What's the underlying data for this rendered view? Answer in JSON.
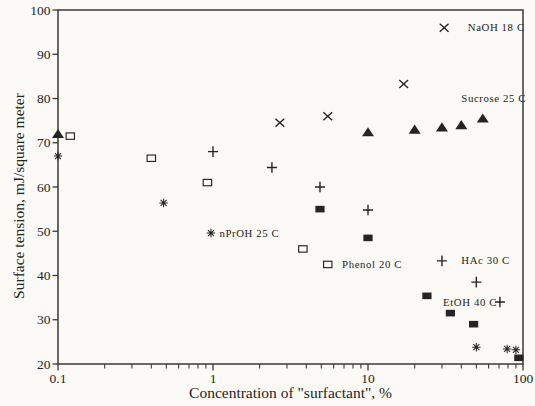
{
  "figure": {
    "background_color": "#fbfaf7",
    "ink_color": "#242424",
    "frame_color": "#3a3a3a"
  },
  "chart_data": {
    "type": "scatter",
    "title": "",
    "xlabel": "Concentration of \"surfactant\", %",
    "ylabel": "Surface tension, mJ/square meter",
    "x_scale": "log",
    "y_scale": "linear",
    "xlim": [
      0.1,
      100
    ],
    "ylim": [
      20,
      100
    ],
    "grid": false,
    "frame": "full-box",
    "legend_position": "labels-annotated-beside-series",
    "x_ticks": [
      {
        "v": 0.1,
        "label": "0.1"
      },
      {
        "v": 1,
        "label": "1"
      },
      {
        "v": 10,
        "label": "10"
      },
      {
        "v": 100,
        "label": "100"
      }
    ],
    "x_minor_ticks": [
      0.2,
      0.3,
      0.4,
      0.5,
      0.6,
      0.7,
      0.8,
      0.9,
      2,
      3,
      4,
      5,
      6,
      7,
      8,
      9,
      20,
      30,
      40,
      50,
      60,
      70,
      80,
      90
    ],
    "y_ticks": [
      {
        "v": 20,
        "label": "20"
      },
      {
        "v": 30,
        "label": "30"
      },
      {
        "v": 40,
        "label": "40"
      },
      {
        "v": 50,
        "label": "50"
      },
      {
        "v": 60,
        "label": "60"
      },
      {
        "v": 70,
        "label": "70"
      },
      {
        "v": 80,
        "label": "80"
      },
      {
        "v": 90,
        "label": "90"
      },
      {
        "v": 100,
        "label": "100"
      }
    ],
    "series": [
      {
        "name": "naoh",
        "label": "NaOH 18 C",
        "marker": "x-marker",
        "points": [
          [
            2.7,
            74.5
          ],
          [
            5.5,
            76.0
          ],
          [
            17,
            83.3
          ],
          [
            31,
            96.0
          ]
        ],
        "label_at": [
          44,
          96.0
        ]
      },
      {
        "name": "sucrose",
        "label": "Sucrose 25 C",
        "marker": "triangle-filled-marker",
        "points": [
          [
            0.1,
            72.0
          ],
          [
            10,
            72.4
          ],
          [
            20,
            73.0
          ],
          [
            30,
            73.5
          ],
          [
            40,
            74.0
          ],
          [
            55,
            75.5
          ]
        ],
        "label_at": [
          40,
          80.0
        ]
      },
      {
        "name": "nproh",
        "label": "nPrOH 25 C",
        "marker": "asterisk-marker",
        "points": [
          [
            0.1,
            67.0
          ],
          [
            0.48,
            56.4
          ],
          [
            0.97,
            49.6
          ],
          [
            50,
            23.8
          ],
          [
            79,
            23.4
          ],
          [
            90,
            23.2
          ]
        ],
        "label_at": [
          1.1,
          49.6
        ]
      },
      {
        "name": "phenol",
        "label": "Phenol 20 C",
        "marker": "square-open-marker",
        "points": [
          [
            0.12,
            71.5
          ],
          [
            0.4,
            66.5
          ],
          [
            0.92,
            61.0
          ],
          [
            3.8,
            46.0
          ],
          [
            5.5,
            42.5
          ]
        ],
        "label_at": [
          6.8,
          42.4
        ]
      },
      {
        "name": "hac",
        "label": "HAc 30 C",
        "marker": "plus-marker",
        "points": [
          [
            1.0,
            68.0
          ],
          [
            2.4,
            64.4
          ],
          [
            4.9,
            60.0
          ],
          [
            10,
            54.8
          ],
          [
            30,
            43.3
          ],
          [
            50,
            38.5
          ],
          [
            71,
            34.0
          ]
        ],
        "label_at": [
          40,
          43.3
        ]
      },
      {
        "name": "etoh",
        "label": "EtOH 40 C",
        "marker": "square-filled-marker",
        "points": [
          [
            4.9,
            55.0
          ],
          [
            10,
            48.5
          ],
          [
            24,
            35.4
          ],
          [
            34,
            31.5
          ],
          [
            48,
            29.0
          ],
          [
            94,
            21.4
          ]
        ],
        "label_at": [
          30.5,
          34.0
        ]
      }
    ]
  }
}
